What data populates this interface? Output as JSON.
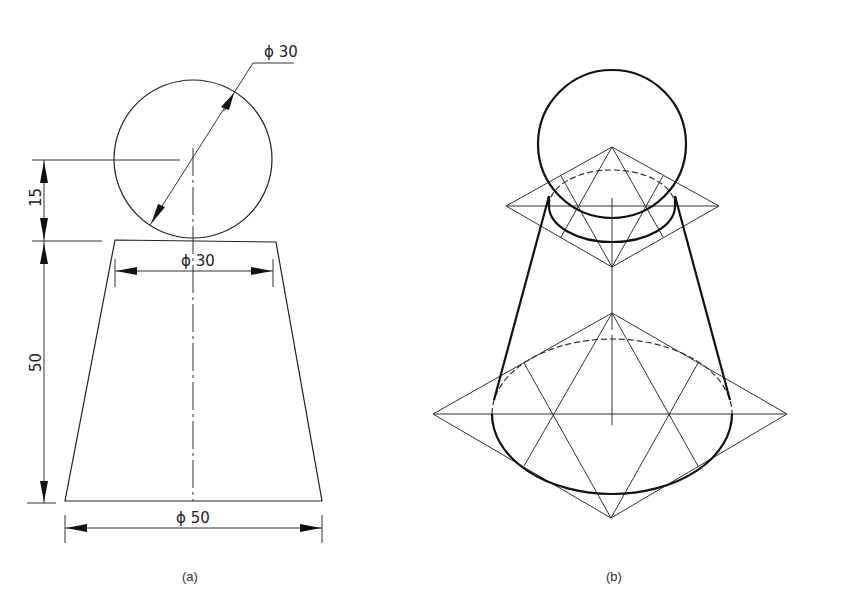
{
  "figure_a": {
    "caption": "(a)",
    "dims": {
      "sphere_diameter": "ϕ 30",
      "top_diameter": "ϕ 30",
      "bottom_diameter": "ϕ 50",
      "sphere_offset": "15",
      "frustum_height": "50"
    }
  },
  "figure_b": {
    "caption": "(b)"
  },
  "colors": {
    "line": "#222222",
    "background": "#ffffff"
  }
}
